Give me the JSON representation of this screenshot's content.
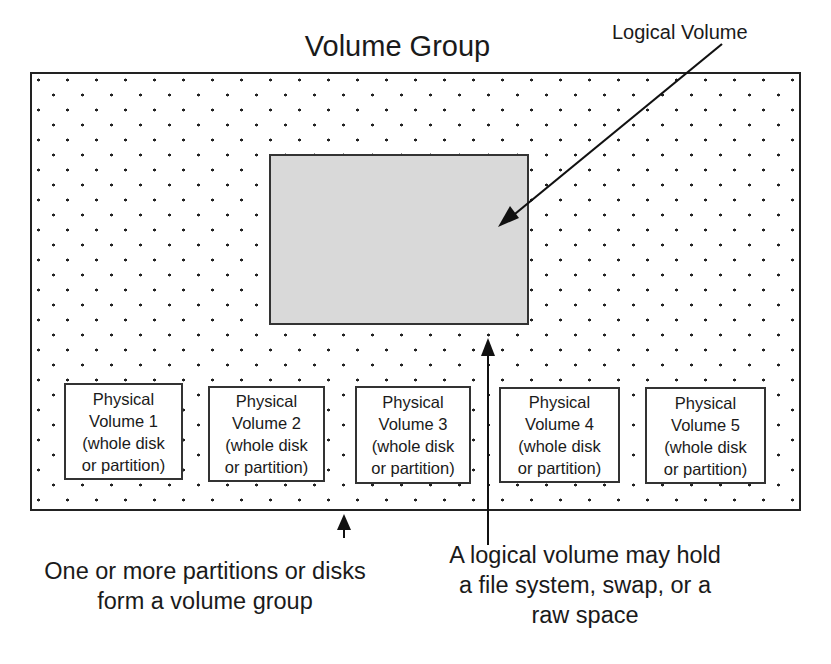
{
  "diagram": {
    "title": "Volume Group",
    "logical_volume_label": "Logical Volume",
    "physical_volumes": [
      {
        "line1": "Physical",
        "line2": "Volume 1",
        "line3": "(whole disk",
        "line4": "or partition)"
      },
      {
        "line1": "Physical",
        "line2": "Volume 2",
        "line3": "(whole disk",
        "line4": "or partition)"
      },
      {
        "line1": "Physical",
        "line2": "Volume 3",
        "line3": "(whole disk",
        "line4": "or partition)"
      },
      {
        "line1": "Physical",
        "line2": "Volume 4",
        "line3": "(whole disk",
        "line4": "or partition)"
      },
      {
        "line1": "Physical",
        "line2": "Volume 5",
        "line3": "(whole disk",
        "line4": "or partition)"
      }
    ],
    "captions": {
      "left": {
        "line1": "One or more partitions or disks",
        "line2": "form a volume group"
      },
      "right": {
        "line1": "A logical volume may hold",
        "line2": "a file system, swap, or a",
        "line3": "raw space"
      }
    },
    "colors": {
      "outline": "#222222",
      "logical_volume_fill": "#d9d9d9",
      "background": "#ffffff",
      "dot_pattern": "#222222"
    }
  }
}
